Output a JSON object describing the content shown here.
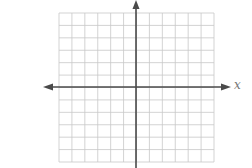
{
  "diagram": {
    "type": "coordinate-plane",
    "x_axis_label": "x",
    "y_axis_label": "",
    "grid": {
      "columns": 12,
      "rows": 12,
      "left": 59,
      "top": 13,
      "right": 214,
      "bottom": 162
    },
    "colors": {
      "grid": "#c8c8c8",
      "axis": "#4a4a4a",
      "label": "#777777"
    }
  }
}
